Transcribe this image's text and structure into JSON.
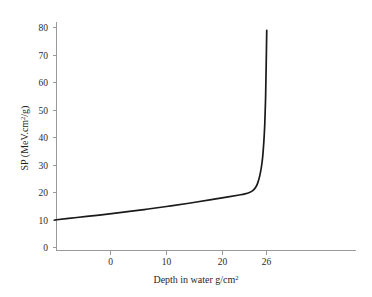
{
  "chart_data": {
    "type": "line",
    "title": "",
    "xlabel": "Depth in water g/cm²",
    "ylabel": "SP (MeV.cm²/g)",
    "xlabel_base": "Depth in water g/cm",
    "xlabel_sup": "2",
    "ylabel_pre": "SP (MeV.cm",
    "ylabel_sup": "2",
    "ylabel_post": "/g)",
    "x_ticks": [
      0,
      10,
      20,
      26
    ],
    "x_tick_labels": [
      "0",
      "10",
      "20",
      "26"
    ],
    "y_ticks": [
      0,
      10,
      20,
      30,
      40,
      50,
      60,
      70,
      80
    ],
    "y_tick_labels": [
      "0",
      "10",
      "20",
      "30",
      "40",
      "50",
      "60",
      "70",
      "80"
    ],
    "xlim": [
      -10,
      44
    ],
    "ylim": [
      0,
      84
    ],
    "grid": false,
    "legend": null,
    "series": [
      {
        "name": "Stopping power",
        "color": "#1a1a1a",
        "x": [
          -10.0,
          -6.0,
          -2.0,
          2.0,
          6.0,
          10.0,
          14.0,
          18.0,
          21.0,
          23.0,
          24.0,
          24.8,
          25.4,
          25.9,
          26.3,
          26.7,
          27.0,
          27.2,
          27.4,
          27.55,
          27.7,
          27.8,
          27.9
        ],
        "y": [
          10.0,
          10.9,
          11.8,
          12.8,
          13.8,
          14.9,
          16.1,
          17.4,
          18.4,
          19.1,
          19.5,
          20.0,
          20.7,
          21.8,
          23.5,
          26.5,
          30.0,
          33.5,
          39.0,
          45.0,
          55.0,
          66.0,
          79.0
        ]
      }
    ],
    "curve_end_value": 79,
    "plateau_start_value": 10,
    "knee_value": 20
  },
  "figure": {
    "background": "#ffffff",
    "axis_color": "#9a9a9a",
    "text_color": "#1f1f1f",
    "curve_color": "#1a1a1a"
  }
}
